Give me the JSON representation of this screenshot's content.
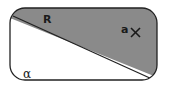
{
  "diagram": {
    "type": "set-region-diagram",
    "labels": {
      "region_line": "R",
      "point": "a",
      "point_marker": "×",
      "universe": "α"
    },
    "colors": {
      "shaded": "#8a8a8a",
      "outline": "#222222",
      "background": "#ffffff"
    }
  }
}
